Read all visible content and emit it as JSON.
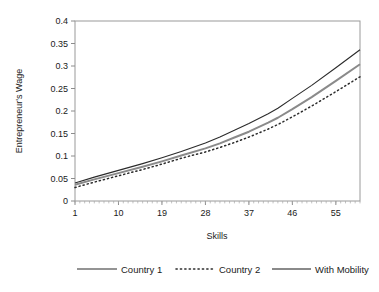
{
  "chart_data": {
    "type": "line",
    "title": "",
    "xlabel": "Skills",
    "ylabel": "Entrepreneur's Wage",
    "xlim": [
      1,
      60
    ],
    "ylim": [
      0,
      0.4
    ],
    "grid": false,
    "legend_position": "bottom",
    "x_tick_labels": [
      "1",
      "10",
      "19",
      "28",
      "37",
      "46",
      "55"
    ],
    "x_tick_values": [
      1,
      10,
      19,
      28,
      37,
      46,
      55
    ],
    "y_tick_labels": [
      "0",
      "0.05",
      "0.1",
      "0.15",
      "0.2",
      "0.25",
      "0.3",
      "0.35",
      "0.4"
    ],
    "y_tick_values": [
      0,
      0.05,
      0.1,
      0.15,
      0.2,
      0.25,
      0.3,
      0.35,
      0.4
    ],
    "x": [
      1,
      5,
      10,
      15,
      19,
      23,
      28,
      31,
      34,
      37,
      41,
      43,
      46,
      50,
      55,
      60
    ],
    "series": [
      {
        "name": "Country 1",
        "style": "solid-thin",
        "color": "#2b2b2b",
        "width": 1.1,
        "values": [
          0.04,
          0.053,
          0.068,
          0.083,
          0.096,
          0.11,
          0.129,
          0.142,
          0.157,
          0.172,
          0.194,
          0.206,
          0.228,
          0.257,
          0.296,
          0.336
        ]
      },
      {
        "name": "Country 2",
        "style": "dotted",
        "color": "#2b2b2b",
        "width": 1.5,
        "values": [
          0.03,
          0.042,
          0.056,
          0.07,
          0.082,
          0.095,
          0.109,
          0.119,
          0.13,
          0.142,
          0.16,
          0.17,
          0.187,
          0.211,
          0.243,
          0.276
        ]
      },
      {
        "name": "With Mobility",
        "style": "solid-thick",
        "color": "#8a8a8a",
        "width": 2.0,
        "values": [
          0.036,
          0.048,
          0.062,
          0.076,
          0.088,
          0.101,
          0.117,
          0.128,
          0.141,
          0.154,
          0.174,
          0.185,
          0.204,
          0.231,
          0.267,
          0.304
        ]
      }
    ]
  },
  "legend": {
    "items": [
      {
        "label": "Country 1"
      },
      {
        "label": "Country 2"
      },
      {
        "label": "With Mobility"
      }
    ]
  }
}
